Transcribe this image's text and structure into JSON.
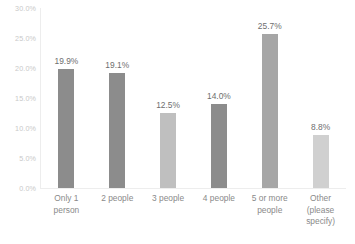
{
  "chart_data": {
    "type": "bar",
    "title": "",
    "xlabel": "",
    "ylabel": "",
    "categories": [
      "Only 1\nperson",
      "2 people",
      "3 people",
      "4 people",
      "5 or more\npeople",
      "Other\n(please\nspecify)"
    ],
    "values": [
      19.9,
      19.1,
      12.5,
      14.0,
      25.7,
      8.8
    ],
    "value_labels": [
      "19.9%",
      "19.1%",
      "12.5%",
      "14.0%",
      "25.7%",
      "8.8%"
    ],
    "bar_colors": [
      "#8c8c8c",
      "#8c8c8c",
      "#bfbfbf",
      "#8c8c8c",
      "#a6a6a6",
      "#d0d0d0"
    ],
    "ylim": [
      0,
      30
    ],
    "ytick_values": [
      30.0,
      25.0,
      20.0,
      15.0,
      10.0,
      5.0,
      0.0
    ],
    "ytick_labels": [
      "30.0%",
      "25.0%",
      "20.0%",
      "15.0%",
      "10.0%",
      "5.0%",
      "0.0%"
    ],
    "grid": false,
    "legend": "none",
    "axis_color": "#ededed",
    "tick_label_color": "#c9c9c9",
    "category_label_color": "#8a8a8a",
    "value_label_color": "#6e6e6e",
    "background": "#ffffff"
  }
}
